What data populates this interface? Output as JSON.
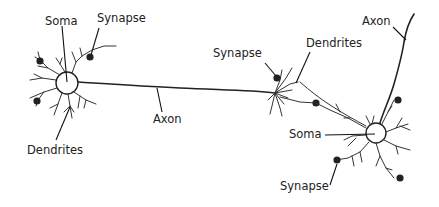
{
  "diagram": {
    "type": "neuron-anatomy",
    "neurons": [
      {
        "id": "left-neuron",
        "labels": {
          "soma": "Soma",
          "synapse": "Synapse",
          "dendrites": "Dendrites",
          "axon": "Axon"
        }
      },
      {
        "id": "right-neuron",
        "labels": {
          "synapse_top": "Synapse",
          "dendrites": "Dendrites",
          "axon": "Axon",
          "soma": "Soma",
          "synapse_bottom": "Synapse"
        }
      }
    ],
    "colors": {
      "stroke": "#222222",
      "background": "#ffffff",
      "text": "#222222"
    }
  }
}
